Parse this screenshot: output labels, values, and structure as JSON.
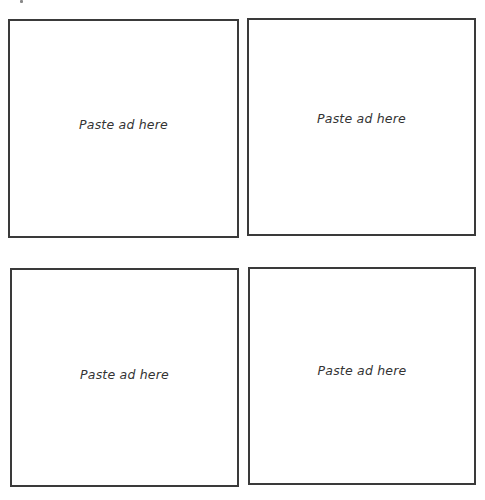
{
  "page": {
    "background": "#ffffff",
    "border_color": "#3a3a3a",
    "text_color": "#333333"
  },
  "ad_slots": [
    {
      "label": "Paste ad here"
    },
    {
      "label": "Paste ad here"
    },
    {
      "label": "Paste ad here"
    },
    {
      "label": "Paste ad here"
    }
  ]
}
